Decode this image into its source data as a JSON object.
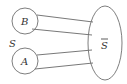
{
  "diagram": {
    "nodes": [
      {
        "id": "B",
        "label": "B",
        "shape": "circle",
        "cx": 25,
        "cy": 21,
        "r": 13
      },
      {
        "id": "A",
        "label": "A",
        "shape": "circle",
        "cx": 25,
        "cy": 61,
        "r": 13
      },
      {
        "id": "Sbar",
        "label": "S",
        "overline": true,
        "shape": "ellipse",
        "cx": 105,
        "cy": 43,
        "rx": 17,
        "ry": 37
      }
    ],
    "group_label": {
      "text": "S",
      "x": 9,
      "y": 47
    },
    "edges": [
      {
        "from": "B",
        "to": "Sbar",
        "x1": 37,
        "y1": 15,
        "x2": 93,
        "y2": 22
      },
      {
        "from": "B",
        "to": "Sbar",
        "x1": 32,
        "y1": 29,
        "x2": 92,
        "y2": 35
      },
      {
        "from": "A",
        "to": "Sbar",
        "x1": 37,
        "y1": 55,
        "x2": 92,
        "y2": 50
      },
      {
        "from": "A",
        "to": "Sbar",
        "x1": 35,
        "y1": 69,
        "x2": 93,
        "y2": 63
      }
    ],
    "colors": {
      "stroke": "#6f6f6f",
      "text": "#333333",
      "background": "#ffffff"
    }
  }
}
